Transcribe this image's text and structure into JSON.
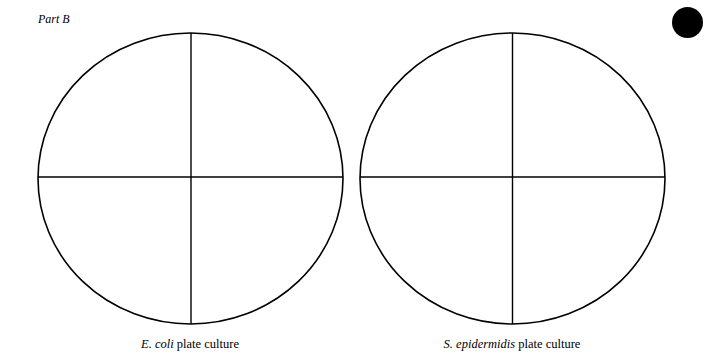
{
  "part_label": "Part B",
  "marker": "filled-circle",
  "plates": [
    {
      "species": "E. coli",
      "suffix": " plate culture",
      "cx": 190.5,
      "cy": 178.5,
      "rx": 152.5,
      "ry": 145.5,
      "divided_into": 4
    },
    {
      "species": "S. epidermidis",
      "suffix": " plate culture",
      "cx": 512.5,
      "cy": 178.5,
      "rx": 152.5,
      "ry": 145.5,
      "divided_into": 4
    }
  ],
  "colors": {
    "ink": "#000000",
    "paper": "#ffffff"
  }
}
